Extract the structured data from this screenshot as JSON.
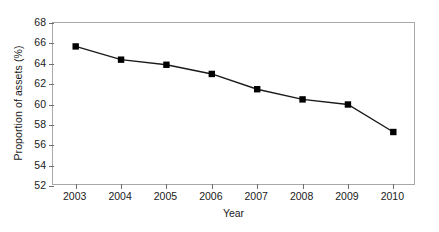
{
  "chart_data": {
    "type": "line",
    "title": "",
    "xlabel": "Year",
    "ylabel": "Proportion of assets (%)",
    "categories": [
      "2003",
      "2004",
      "2005",
      "2006",
      "2007",
      "2008",
      "2009",
      "2010"
    ],
    "x": [
      2003,
      2004,
      2005,
      2006,
      2007,
      2008,
      2009,
      2010
    ],
    "values": [
      65.7,
      64.4,
      63.9,
      63.0,
      61.5,
      60.5,
      60.0,
      57.3
    ],
    "series": [
      {
        "name": "Proportion of assets",
        "values": [
          65.7,
          64.4,
          63.9,
          63.0,
          61.5,
          60.5,
          60.0,
          57.3
        ]
      }
    ],
    "ylim": [
      52,
      68
    ],
    "ytick_step": 2,
    "yticks": [
      52,
      54,
      56,
      58,
      60,
      62,
      64,
      66,
      68
    ],
    "ytick_labels": [
      "52",
      "54",
      "56",
      "58",
      "60",
      "62",
      "64",
      "66",
      "68"
    ],
    "xlim": [
      2002.5,
      2010.5
    ],
    "grid": false,
    "legend": false,
    "legend_position": "none",
    "marker": "square",
    "marker_color": "#000000",
    "line_color": "#1a1a1a",
    "plot_border_color": "#a8a8a8",
    "background_color": "#ffffff"
  }
}
